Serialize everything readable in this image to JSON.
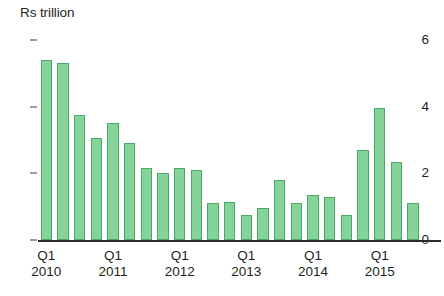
{
  "axis_title": "Rs trillion",
  "colors": {
    "bar_fill": "#86d39a",
    "bar_stroke": "#4aa868",
    "axis": "#2b2b2b",
    "text": "#231f20",
    "background": "#ffffff"
  },
  "y_axis": {
    "ticks": [
      "0",
      "2",
      "4",
      "6"
    ],
    "min": 0,
    "max": 6
  },
  "x_axis": {
    "group_labels": [
      {
        "quarter": "Q1",
        "year": "2010"
      },
      {
        "quarter": "Q1",
        "year": "2011"
      },
      {
        "quarter": "Q1",
        "year": "2012"
      },
      {
        "quarter": "Q1",
        "year": "2013"
      },
      {
        "quarter": "Q1",
        "year": "2014"
      },
      {
        "quarter": "Q1",
        "year": "2015"
      }
    ]
  },
  "chart_data": {
    "type": "bar",
    "title": "",
    "xlabel": "",
    "ylabel": "Rs trillion",
    "ylim": [
      0,
      6
    ],
    "yticks": [
      0,
      2,
      4,
      6
    ],
    "grid": false,
    "legend": null,
    "categories": [
      "Q1 2010",
      "Q2 2010",
      "Q3 2010",
      "Q4 2010",
      "Q1 2011",
      "Q2 2011",
      "Q3 2011",
      "Q4 2011",
      "Q1 2012",
      "Q2 2012",
      "Q3 2012",
      "Q4 2012",
      "Q1 2013",
      "Q2 2013",
      "Q3 2013",
      "Q4 2013",
      "Q1 2014",
      "Q2 2014",
      "Q3 2014",
      "Q4 2014",
      "Q1 2015",
      "Q2 2015",
      "Q3 2015",
      "Q4 2015"
    ],
    "values": [
      5.4,
      5.3,
      3.75,
      3.05,
      3.5,
      2.9,
      2.15,
      2.0,
      2.15,
      2.1,
      1.1,
      1.15,
      0.75,
      0.95,
      1.8,
      1.1,
      1.35,
      1.3,
      0.75,
      2.7,
      3.95,
      2.35,
      1.1,
      0.0
    ],
    "bar_color": "#86d39a",
    "bar_edge_color": "#4aa868"
  }
}
